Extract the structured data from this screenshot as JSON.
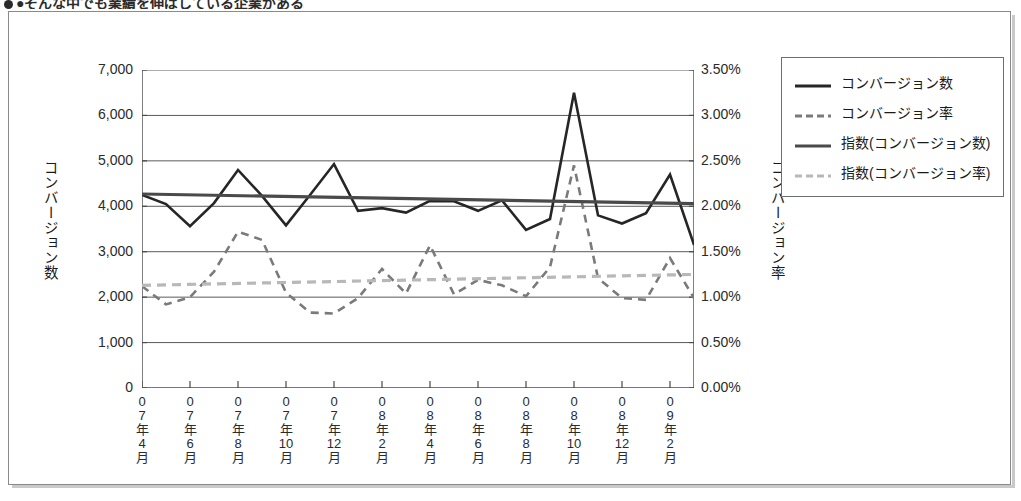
{
  "heading": {
    "text": "●そんな中でも業績を伸ばしている企業がある",
    "bullet_icon": "bullet-dot-icon"
  },
  "legend": {
    "position": "right",
    "items": [
      {
        "label": "コンバージョン数",
        "style": "solid",
        "color": "#262626",
        "thickness": 3,
        "icon": "solid-line-icon"
      },
      {
        "label": "コンバージョン率",
        "style": "dashed",
        "color": "#7a7a7a",
        "thickness": 3,
        "icon": "dashed-line-icon"
      },
      {
        "label": "指数(コンバージョン数)",
        "style": "solid",
        "color": "#4a4a4a",
        "thickness": 3,
        "icon": "solid-line-icon"
      },
      {
        "label": "指数(コンバージョン率)",
        "style": "dashed",
        "color": "#b8b8b8",
        "thickness": 3,
        "icon": "dashed-line-icon"
      }
    ]
  },
  "chart_data": {
    "type": "line",
    "title": "",
    "xlabel": "",
    "ylabel": "コンバージョン数",
    "y2label": "コンバージョン率",
    "ylim": [
      0,
      7000
    ],
    "y2lim": [
      0,
      0.035
    ],
    "grid": true,
    "y_ticks": [
      "0",
      "1,000",
      "2,000",
      "3,000",
      "4,000",
      "5,000",
      "6,000",
      "7,000"
    ],
    "y_tick_values": [
      0,
      1000,
      2000,
      3000,
      4000,
      5000,
      6000,
      7000
    ],
    "y2_ticks": [
      "0.00%",
      "0.50%",
      "1.00%",
      "1.50%",
      "2.00%",
      "2.50%",
      "3.00%",
      "3.50%"
    ],
    "y2_tick_values": [
      0,
      0.005,
      0.01,
      0.015,
      0.02,
      0.025,
      0.03,
      0.035
    ],
    "x_tick_labels": [
      "07年4月",
      "07年6月",
      "07年8月",
      "07年10月",
      "07年12月",
      "08年2月",
      "08年4月",
      "08年6月",
      "08年8月",
      "08年10月",
      "08年12月",
      "09年2月"
    ],
    "x_tick_label_lines": [
      [
        "0",
        "7",
        "年",
        "4",
        "月"
      ],
      [
        "0",
        "7",
        "年",
        "6",
        "月"
      ],
      [
        "0",
        "7",
        "年",
        "8",
        "月"
      ],
      [
        "0",
        "7",
        "年",
        "10",
        "月"
      ],
      [
        "0",
        "7",
        "年",
        "12",
        "月"
      ],
      [
        "0",
        "8",
        "年",
        "2",
        "月"
      ],
      [
        "0",
        "8",
        "年",
        "4",
        "月"
      ],
      [
        "0",
        "8",
        "年",
        "6",
        "月"
      ],
      [
        "0",
        "8",
        "年",
        "8",
        "月"
      ],
      [
        "0",
        "8",
        "年",
        "10",
        "月"
      ],
      [
        "0",
        "8",
        "年",
        "12",
        "月"
      ],
      [
        "0",
        "9",
        "年",
        "2",
        "月"
      ]
    ],
    "x_categories": [
      "07年4月",
      "07年5月",
      "07年6月",
      "07年7月",
      "07年8月",
      "07年9月",
      "07年10月",
      "07年11月",
      "07年12月",
      "08年1月",
      "08年2月",
      "08年3月",
      "08年4月",
      "08年5月",
      "08年6月",
      "08年7月",
      "08年8月",
      "08年9月",
      "08年10月",
      "08年11月",
      "08年12月",
      "09年1月"
    ],
    "series": [
      {
        "name": "コンバージョン数",
        "axis": "left",
        "style": "solid",
        "color": "#262626",
        "values": [
          4250,
          4050,
          3560,
          4070,
          4800,
          4230,
          3580,
          4250,
          4930,
          3900,
          3960,
          3860,
          4120,
          4110,
          3900,
          4130,
          3480,
          3720,
          6500,
          3800,
          3620,
          3850,
          4700,
          3150
        ]
      },
      {
        "name": "コンバージョン率",
        "axis": "right",
        "style": "dashed",
        "color": "#7a7a7a",
        "values": [
          0.0112,
          0.0092,
          0.01,
          0.0128,
          0.0172,
          0.0163,
          0.0105,
          0.0083,
          0.0082,
          0.0099,
          0.0131,
          0.0104,
          0.0157,
          0.0103,
          0.0119,
          0.0113,
          0.0101,
          0.0133,
          0.0245,
          0.0121,
          0.0099,
          0.0097,
          0.0143,
          0.0099
        ]
      },
      {
        "name": "指数(コンバージョン数)",
        "axis": "left",
        "style": "solid",
        "color": "#4a4a4a",
        "trend": true,
        "values": [
          4270,
          4060
        ]
      },
      {
        "name": "指数(コンバージョン率)",
        "axis": "right",
        "style": "dashed",
        "color": "#b8b8b8",
        "trend": true,
        "values": [
          0.0113,
          0.0125
        ]
      }
    ]
  }
}
